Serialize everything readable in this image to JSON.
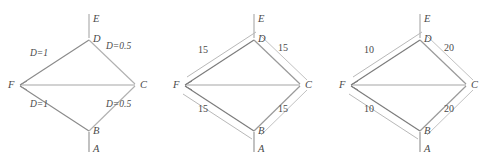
{
  "figure": {
    "panels": [
      {
        "id": "panel-1",
        "name": "diagram-distance-weights",
        "nodes": [
          {
            "key": "E",
            "label": "E",
            "x": 93,
            "y": 20
          },
          {
            "key": "D",
            "label": "D",
            "x": 93,
            "y": 40
          },
          {
            "key": "F",
            "label": "F",
            "x": 8,
            "y": 86
          },
          {
            "key": "C",
            "label": "C",
            "x": 140,
            "y": 86
          },
          {
            "key": "B",
            "label": "B",
            "x": 93,
            "y": 132
          },
          {
            "key": "A",
            "label": "A",
            "x": 93,
            "y": 150
          }
        ],
        "edge_labels": [
          {
            "key": "FD",
            "text": "D=1",
            "x": 30,
            "y": 54
          },
          {
            "key": "DC",
            "text": "D=0.5",
            "x": 112,
            "y": 47
          },
          {
            "key": "FB",
            "text": "D=1",
            "x": 30,
            "y": 104
          },
          {
            "key": "BC",
            "text": "D=0.5",
            "x": 110,
            "y": 104
          }
        ]
      },
      {
        "id": "panel-2",
        "name": "diagram-weights-15",
        "nodes": [
          {
            "key": "E",
            "label": "E",
            "x": 93,
            "y": 20
          },
          {
            "key": "D",
            "label": "D",
            "x": 93,
            "y": 40
          },
          {
            "key": "F",
            "label": "F",
            "x": 8,
            "y": 86
          },
          {
            "key": "C",
            "label": "C",
            "x": 140,
            "y": 86
          },
          {
            "key": "B",
            "label": "B",
            "x": 93,
            "y": 132
          },
          {
            "key": "A",
            "label": "A",
            "x": 93,
            "y": 150
          }
        ],
        "edge_labels": [
          {
            "key": "FD",
            "text": "15",
            "x": 36,
            "y": 49
          },
          {
            "key": "DC",
            "text": "15",
            "x": 116,
            "y": 47
          },
          {
            "key": "FB",
            "text": "15",
            "x": 36,
            "y": 108
          },
          {
            "key": "BC",
            "text": "15",
            "x": 116,
            "y": 108
          }
        ]
      },
      {
        "id": "panel-3",
        "name": "diagram-weights-10-20",
        "nodes": [
          {
            "key": "E",
            "label": "E",
            "x": 93,
            "y": 20
          },
          {
            "key": "D",
            "label": "D",
            "x": 93,
            "y": 40
          },
          {
            "key": "F",
            "label": "F",
            "x": 8,
            "y": 86
          },
          {
            "key": "C",
            "label": "C",
            "x": 140,
            "y": 86
          },
          {
            "key": "B",
            "label": "B",
            "x": 93,
            "y": 132
          },
          {
            "key": "A",
            "label": "A",
            "x": 93,
            "y": 150
          }
        ],
        "edge_labels": [
          {
            "key": "FD",
            "text": "10",
            "x": 36,
            "y": 49
          },
          {
            "key": "DC",
            "text": "20",
            "x": 116,
            "y": 47
          },
          {
            "key": "FB",
            "text": "10",
            "x": 36,
            "y": 108
          },
          {
            "key": "BC",
            "text": "20",
            "x": 116,
            "y": 108
          }
        ]
      }
    ]
  },
  "colors": {
    "line_dark": "#6b6b6b",
    "line_light": "#b5b5b5",
    "line_mid": "#8f8f8f",
    "text": "#4a4a4a",
    "background": "#ffffff"
  }
}
